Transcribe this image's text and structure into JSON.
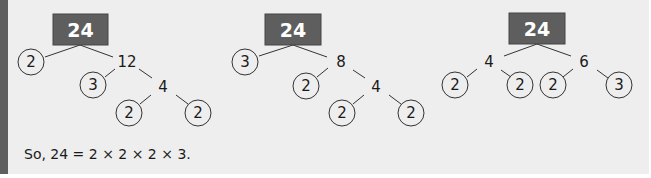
{
  "colors": {
    "panel_bg": "#eeeeee",
    "side_bar": "#5e5e5e",
    "root_box": "#5e5e5e",
    "root_text": "#ffffff",
    "line": "#333333",
    "text": "#1a1a1a"
  },
  "trees": [
    {
      "root": "24",
      "nodes": {
        "a_circle": "2",
        "b_composite": "12",
        "c_circle": "3",
        "d_composite": "4",
        "e_circle": "2",
        "f_circle": "2"
      }
    },
    {
      "root": "24",
      "nodes": {
        "a_circle": "3",
        "b_composite": "8",
        "c_circle": "2",
        "d_composite": "4",
        "e_circle": "2",
        "f_circle": "2"
      }
    },
    {
      "root": "24",
      "nodes": {
        "left_composite": "4",
        "right_composite": "6",
        "ll_circle": "2",
        "lr_circle": "2",
        "rl_circle": "2",
        "rr_circle": "3"
      }
    }
  ],
  "conclusion": "So, 24 = 2 × 2 × 2 × 3."
}
